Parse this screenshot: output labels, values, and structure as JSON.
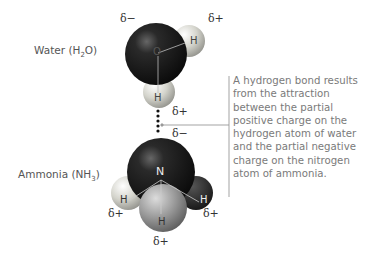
{
  "water": {
    "label_pre": "Water (H",
    "label_sub": "2",
    "label_post": "O)",
    "atoms": {
      "oxygen": "O",
      "h1": "H",
      "h2": "H"
    },
    "charges": {
      "oxygen": "δ−",
      "h_right": "δ+",
      "h_bottom": "δ+"
    }
  },
  "ammonia": {
    "label_pre": "Ammonia (NH",
    "label_sub": "3",
    "label_post": ")",
    "atoms": {
      "nitrogen": "N",
      "h_left": "H",
      "h_right": "H",
      "h_bottom": "H"
    },
    "charges": {
      "nitrogen": "δ−",
      "h_left": "δ+",
      "h_right": "δ+",
      "h_bottom": "δ+"
    }
  },
  "caption": "A hydrogen bond results from the attraction between the partial positive charge on the hydrogen atom of water and the partial negative charge on the nitrogen atom of ammonia.",
  "colors": {
    "oxygen": "#1e1e1e",
    "nitrogen": "#111111",
    "hydrogen": "#d8d8d0",
    "bracket": "#999999"
  }
}
